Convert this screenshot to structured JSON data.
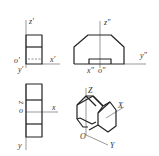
{
  "figure": {
    "views": {
      "side_view_top_left": {
        "labels": {
          "z": "z'",
          "o": "o'",
          "x": "x'",
          "y": "y'"
        }
      },
      "front_view_top_right": {
        "labels": {
          "z": "z\"",
          "y": "y\"",
          "x": "x\"",
          "o": "o\""
        }
      },
      "top_view_bottom_left": {
        "labels": {
          "z": "z",
          "o": "o",
          "x": "x",
          "y": "y"
        }
      },
      "isometric_view_bottom_right": {
        "labels": {
          "z": "Z",
          "x": "X",
          "o": "O",
          "y": "Y"
        }
      }
    },
    "colors": {
      "line": "#222222",
      "axis": "#555555",
      "background": "#ffffff"
    }
  }
}
